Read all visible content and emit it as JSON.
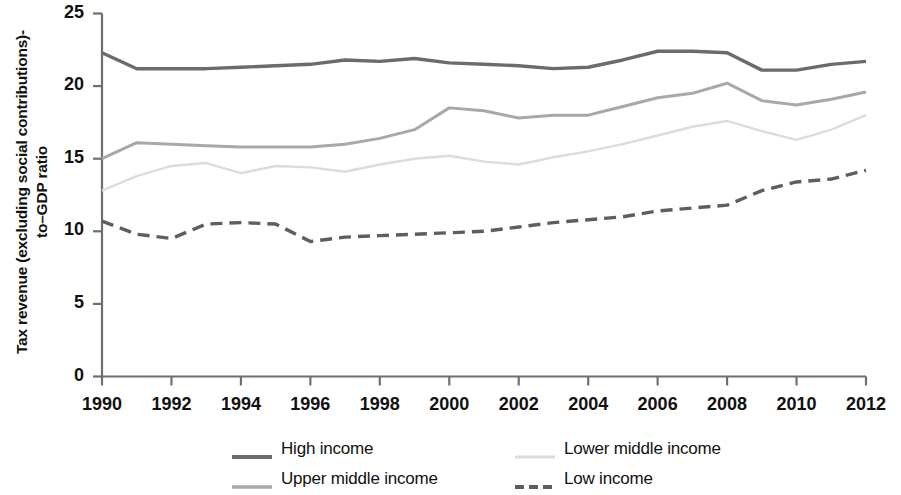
{
  "chart_data": {
    "type": "line",
    "title": "",
    "xlabel": "",
    "ylabel": "Tax revenue (excluding social contributions)-to–GDP ratio",
    "xlim": [
      1990,
      2012
    ],
    "ylim": [
      0,
      25
    ],
    "grid": false,
    "legend_position": "bottom",
    "y_ticks": [
      "0",
      "5",
      "10",
      "15",
      "20",
      "25"
    ],
    "y_tick_values": [
      0,
      5,
      10,
      15,
      20,
      25
    ],
    "x_ticks": [
      "1990",
      "1992",
      "1994",
      "1996",
      "1998",
      "2000",
      "2002",
      "2004",
      "2006",
      "2008",
      "2010",
      "2012"
    ],
    "x_tick_values": [
      1990,
      1992,
      1994,
      1996,
      1998,
      2000,
      2002,
      2004,
      2006,
      2008,
      2010,
      2012
    ],
    "x": [
      1990,
      1991,
      1992,
      1993,
      1994,
      1995,
      1996,
      1997,
      1998,
      1999,
      2000,
      2001,
      2002,
      2003,
      2004,
      2005,
      2006,
      2007,
      2008,
      2009,
      2010,
      2011,
      2012
    ],
    "series": [
      {
        "name": "High income",
        "color": "#6b6b6b",
        "style": "solid",
        "width": 3.4,
        "values": [
          22.3,
          21.2,
          21.2,
          21.2,
          21.3,
          21.4,
          21.5,
          21.8,
          21.7,
          21.9,
          21.6,
          21.5,
          21.4,
          21.2,
          21.3,
          21.8,
          22.4,
          22.4,
          22.3,
          21.1,
          21.1,
          21.5,
          21.7
        ]
      },
      {
        "name": "Upper middle income",
        "color": "#a8a8a8",
        "style": "solid",
        "width": 3.0,
        "values": [
          15.0,
          16.1,
          16.0,
          15.9,
          15.8,
          15.8,
          15.8,
          16.0,
          16.4,
          17.0,
          18.5,
          18.3,
          17.8,
          18.0,
          18.0,
          18.6,
          19.2,
          19.5,
          20.2,
          19.0,
          18.7,
          19.1,
          19.6
        ]
      },
      {
        "name": "Lower middle income",
        "color": "#dcdcdc",
        "style": "solid",
        "width": 2.4,
        "values": [
          12.8,
          13.8,
          14.5,
          14.7,
          14.0,
          14.5,
          14.4,
          14.1,
          14.6,
          15.0,
          15.2,
          14.8,
          14.6,
          15.1,
          15.5,
          16.0,
          16.6,
          17.2,
          17.6,
          16.9,
          16.3,
          17.0,
          18.0
        ]
      },
      {
        "name": "Low income",
        "color": "#5e5e5e",
        "style": "dashed",
        "width": 3.4,
        "values": [
          10.7,
          9.8,
          9.5,
          10.5,
          10.6,
          10.5,
          9.3,
          9.6,
          9.7,
          9.8,
          9.9,
          10.0,
          10.3,
          10.6,
          10.8,
          11.0,
          11.4,
          11.6,
          11.8,
          12.8,
          13.4,
          13.6,
          14.2
        ]
      }
    ]
  },
  "legend": {
    "items": [
      {
        "label": "High income",
        "key": "high-income"
      },
      {
        "label": "Lower middle income",
        "key": "lower-middle-income"
      },
      {
        "label": "Upper middle income",
        "key": "upper-middle-income"
      },
      {
        "label": "Low income",
        "key": "low-income"
      }
    ]
  }
}
